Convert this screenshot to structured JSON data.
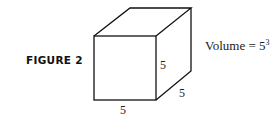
{
  "figure": {
    "label": "FIGURE 2",
    "volume_text": "Volume = 5",
    "volume_exponent": "3",
    "dimensions": {
      "height": "5",
      "width": "5",
      "depth": "5"
    }
  }
}
